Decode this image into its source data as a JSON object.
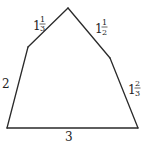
{
  "diagram": {
    "shape": "pentagon",
    "sides": [
      {
        "id": "top-left",
        "label": {
          "whole": "1",
          "numerator": "1",
          "denominator": "3"
        },
        "value": 1.3333
      },
      {
        "id": "top-right",
        "label": {
          "whole": "1",
          "numerator": "1",
          "denominator": "2"
        },
        "value": 1.5
      },
      {
        "id": "right",
        "label": {
          "whole": "1",
          "numerator": "2",
          "denominator": "3"
        },
        "value": 1.6667
      },
      {
        "id": "bottom",
        "label": {
          "whole": "3",
          "numerator": "",
          "denominator": ""
        },
        "value": 3
      },
      {
        "id": "left",
        "label": {
          "whole": "2",
          "numerator": "",
          "denominator": ""
        },
        "value": 2
      }
    ],
    "colors": {
      "stroke": "#2a2a2a",
      "text": "#222222",
      "background": "#ffffff"
    }
  }
}
